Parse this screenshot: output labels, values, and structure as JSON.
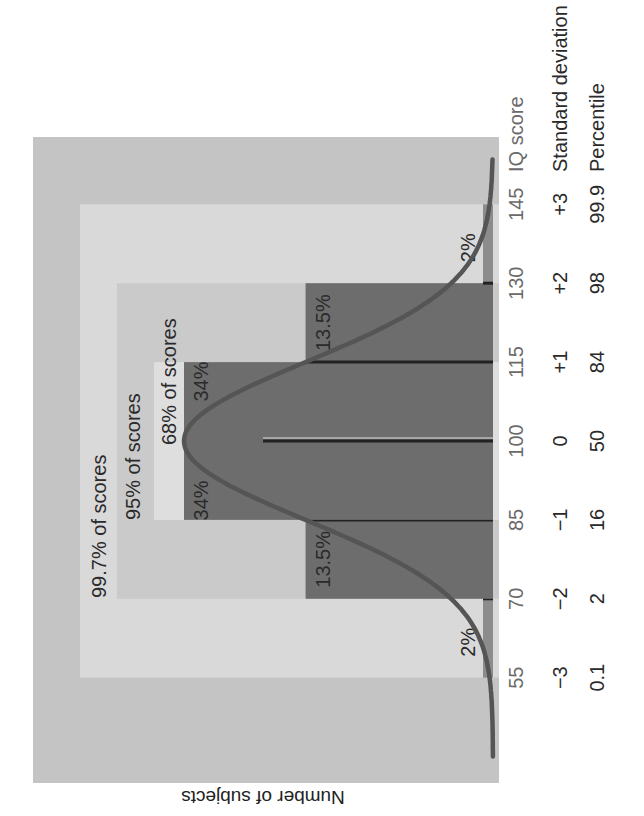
{
  "chart_data": {
    "type": "area",
    "title": "",
    "orientation": "rotated-90-ccw",
    "xlabel": "IQ score",
    "ylabel": "Number of subjects",
    "x_ticks": [
      55,
      70,
      85,
      100,
      115,
      130,
      145
    ],
    "x_range": [
      40,
      160
    ],
    "row_labels": [
      {
        "name": "IQ score",
        "values": [
          "55",
          "70",
          "85",
          "100",
          "115",
          "130",
          "145"
        ]
      },
      {
        "name": "Standard deviation",
        "values": [
          "−3",
          "−2",
          "−1",
          "0",
          "+1",
          "+2",
          "+3"
        ]
      },
      {
        "name": "Percentile",
        "values": [
          "0.1",
          "2",
          "16",
          "50",
          "84",
          "98",
          "99.9"
        ]
      }
    ],
    "distribution": {
      "type": "normal",
      "mean": 100,
      "sd": 15
    },
    "segments": [
      {
        "from": 55,
        "to": 70,
        "percent": 2,
        "label": "2%"
      },
      {
        "from": 70,
        "to": 85,
        "percent": 13.5,
        "label": "13.5%"
      },
      {
        "from": 85,
        "to": 100,
        "percent": 34,
        "label": "34%"
      },
      {
        "from": 100,
        "to": 115,
        "percent": 34,
        "label": "34%"
      },
      {
        "from": 115,
        "to": 130,
        "percent": 13.5,
        "label": "13.5%"
      },
      {
        "from": 130,
        "to": 145,
        "percent": 2,
        "label": "2%"
      }
    ],
    "bands": [
      {
        "from": 55,
        "to": 145,
        "label": "99.7% of scores"
      },
      {
        "from": 70,
        "to": 130,
        "label": "95% of scores"
      },
      {
        "from": 85,
        "to": 115,
        "label": "68% of scores"
      }
    ],
    "grid": false,
    "legend": "none"
  },
  "colors": {
    "page_bg": "#ffffff",
    "plot_bg": "#c4c4c4",
    "band_997": "#d9d9d9",
    "band_95": "#cacaca",
    "band_68": "#dedede",
    "bar_dark": "#6d6d6d",
    "bar_light": "#8c8c8c",
    "curve": "#555555",
    "text": "#2a2a2a",
    "iq_text": "#6a6a6a"
  }
}
